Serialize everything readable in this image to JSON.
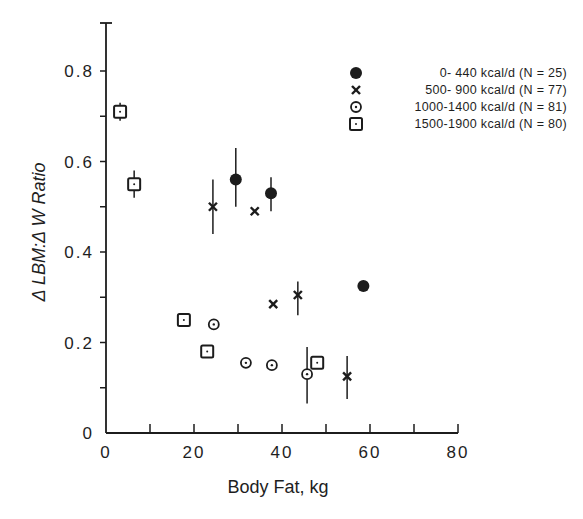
{
  "chart_data": {
    "type": "scatter",
    "title": "",
    "xlabel": "Body Fat, kg",
    "ylabel": "Δ LBM:Δ W Ratio",
    "xlim": [
      0,
      80
    ],
    "ylim": [
      0,
      0.9
    ],
    "x_ticks": [
      0,
      20,
      40,
      60,
      80
    ],
    "x_tick_labels": [
      "0",
      "20",
      "40",
      "60",
      "80"
    ],
    "x_minor_ticks": [
      10,
      30,
      50,
      70
    ],
    "y_ticks": [
      0,
      0.2,
      0.4,
      0.6,
      0.8
    ],
    "y_tick_labels": [
      "0",
      "0.2",
      "0.4",
      "0.6",
      "0.8"
    ],
    "y_minor_ticks": [
      0.1,
      0.3,
      0.5,
      0.7
    ],
    "grid": false,
    "legend_position": "upper right",
    "series": [
      {
        "name": "0- 440 kcal/d (N = 25)",
        "marker": "filled-circle",
        "points": [
          {
            "x": 29.5,
            "y": 0.56,
            "err_low": 0.5,
            "err_high": 0.63
          },
          {
            "x": 37.5,
            "y": 0.53,
            "err_low": 0.49,
            "err_high": 0.565
          },
          {
            "x": 58.5,
            "y": 0.325
          }
        ]
      },
      {
        "name": "500- 900 kcal/d (N = 77)",
        "marker": "cross",
        "points": [
          {
            "x": 24.3,
            "y": 0.5,
            "err_low": 0.44,
            "err_high": 0.56
          },
          {
            "x": 33.8,
            "y": 0.49
          },
          {
            "x": 38.0,
            "y": 0.285
          },
          {
            "x": 43.6,
            "y": 0.305,
            "err_low": 0.26,
            "err_high": 0.335
          },
          {
            "x": 54.8,
            "y": 0.125,
            "err_low": 0.075,
            "err_high": 0.17
          }
        ]
      },
      {
        "name": "1000-1400 kcal/d (N = 81)",
        "marker": "dotted-circle",
        "points": [
          {
            "x": 24.5,
            "y": 0.24
          },
          {
            "x": 31.8,
            "y": 0.155
          },
          {
            "x": 37.7,
            "y": 0.15
          },
          {
            "x": 45.7,
            "y": 0.13,
            "err_low": 0.065,
            "err_high": 0.19
          }
        ]
      },
      {
        "name": "1500-1900 kcal/d (N = 80)",
        "marker": "dotted-square",
        "points": [
          {
            "x": 3.2,
            "y": 0.71,
            "err_low": 0.69,
            "err_high": 0.73
          },
          {
            "x": 6.4,
            "y": 0.55,
            "err_low": 0.52,
            "err_high": 0.58
          },
          {
            "x": 17.7,
            "y": 0.25
          },
          {
            "x": 23.0,
            "y": 0.18
          },
          {
            "x": 48.0,
            "y": 0.155
          }
        ]
      }
    ]
  }
}
